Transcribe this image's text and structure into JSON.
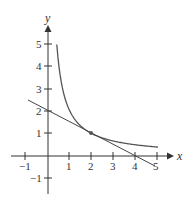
{
  "chart_data": {
    "type": "line",
    "title": "",
    "xlabel": "x",
    "ylabel": "y",
    "xlim": [
      -1,
      5
    ],
    "ylim": [
      -1,
      5
    ],
    "x_ticks": [
      "-1",
      "1",
      "2",
      "3",
      "4",
      "5"
    ],
    "y_ticks": [
      "-1",
      "1",
      "2",
      "3",
      "4",
      "5"
    ],
    "grid": false,
    "series": [
      {
        "name": "curve y = 2/x",
        "x": [
          0.4,
          0.5,
          0.75,
          1,
          1.5,
          2,
          2.5,
          3,
          3.5,
          4,
          4.5,
          5
        ],
        "values": [
          5,
          4,
          2.67,
          2,
          1.33,
          1,
          0.8,
          0.67,
          0.57,
          0.5,
          0.44,
          0.4
        ],
        "color": "#555555"
      },
      {
        "name": "tangent line y = 2 - x/2",
        "x": [
          -0.9,
          4.9
        ],
        "values": [
          2.45,
          -0.45
        ],
        "color": "#444444"
      }
    ],
    "annotations": [
      {
        "type": "point",
        "x": 2,
        "y": 1,
        "label": "point of tangency"
      }
    ]
  },
  "labels": {
    "x_axis": "x",
    "y_axis": "y",
    "xticks": [
      "−1",
      "1",
      "2",
      "3",
      "4",
      "5"
    ],
    "yticks": [
      "5",
      "4",
      "3",
      "2",
      "1",
      "−1"
    ]
  }
}
